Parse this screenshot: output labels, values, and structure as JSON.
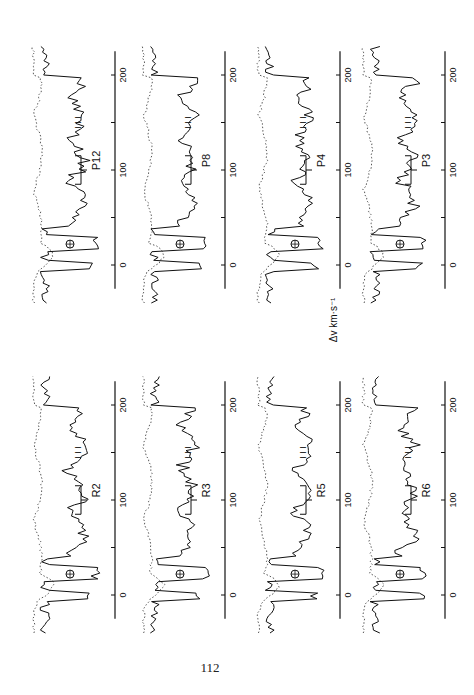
{
  "page_number": "112",
  "axis_label": "Δv km·s⁻¹",
  "chart_data": {
    "type": "line",
    "title": "",
    "xlabel": "Δv km·s⁻¹",
    "ylabel": "",
    "xlim": [
      -40,
      230
    ],
    "x_ticks": [
      0,
      100,
      200
    ],
    "grid": false,
    "legend": "none",
    "layout": "8 panels (rotated 90°), 2 rows × 4 columns",
    "series_styles": {
      "solid": "observed profile",
      "dotted": "comparison profile"
    },
    "markers": {
      "earth_symbol": "⊕",
      "component_ticks": "I I I"
    },
    "panels": [
      {
        "label": "P12",
        "row": 0,
        "col": 0
      },
      {
        "label": "P8",
        "row": 0,
        "col": 1
      },
      {
        "label": "P4",
        "row": 0,
        "col": 2
      },
      {
        "label": "P3",
        "row": 0,
        "col": 3
      },
      {
        "label": "R2",
        "row": 1,
        "col": 0
      },
      {
        "label": "R3",
        "row": 1,
        "col": 1
      },
      {
        "label": "R5",
        "row": 1,
        "col": 2
      },
      {
        "label": "R6",
        "row": 1,
        "col": 3
      }
    ]
  },
  "tick_labels": [
    "0",
    "100",
    "200"
  ],
  "component_mark": "I I I",
  "earth_mark": "⊕"
}
